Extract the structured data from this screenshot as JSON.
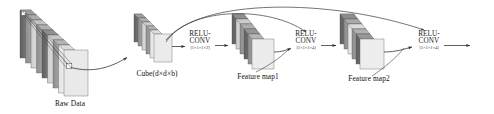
{
  "figure": {
    "type": "neural-network-architecture-diagram"
  },
  "blocks": {
    "raw_data": {
      "label": "Raw Data",
      "slab_count": 9
    },
    "cube": {
      "label": "Cube(d×d×b)",
      "slab_count": 6
    },
    "feature_map1": {
      "label": "Feature map1",
      "slab_count": 6
    },
    "feature_map2": {
      "label": "Feature map2",
      "slab_count": 6
    }
  },
  "operations": [
    {
      "id": "op1",
      "line1": "RELU-",
      "line2": "CONV",
      "dims": "[1×1×1×2]"
    },
    {
      "id": "op2",
      "line1": "RELU-",
      "line2": "CONV",
      "dims": "[1×1×1×4]"
    },
    {
      "id": "op3",
      "line1": "RELU-",
      "line2": "CONV",
      "dims": "[1×1×1×4]"
    }
  ],
  "colors": {
    "slab_dark": "#6f6f6f",
    "slab_mid": "#9a9a9a",
    "slab_light": "#d8d8d8",
    "slab_pale": "#ededed",
    "edge": "#4a4a4a",
    "arrow": "#2b2b2b",
    "text": "#111111"
  }
}
